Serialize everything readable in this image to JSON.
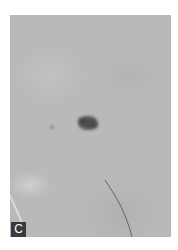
{
  "figure": {
    "panel_label": "C",
    "colors": {
      "background": "#ffffff",
      "skin": "#b9b9b9",
      "lesion": "#4a4a4a",
      "label_bg": "#3a3a3a",
      "label_text": "#ffffff"
    }
  }
}
